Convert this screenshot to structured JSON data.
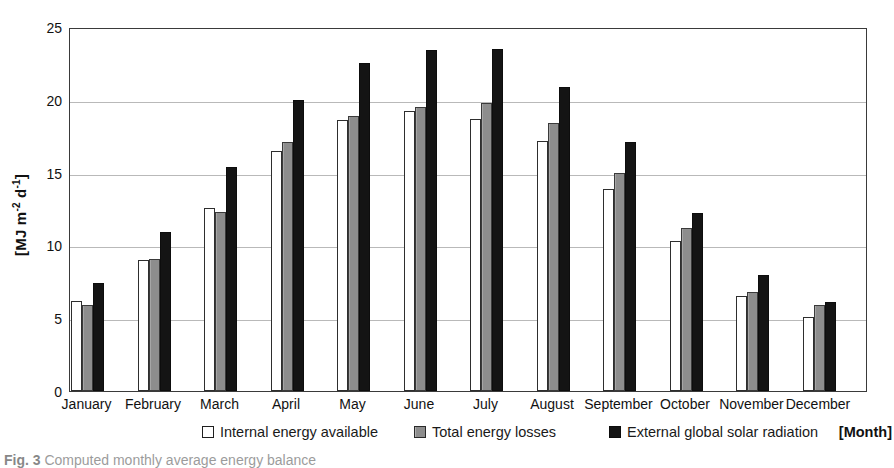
{
  "chart_data": {
    "type": "bar",
    "title": "",
    "xlabel": "[Month]",
    "ylabel": "[MJ m-2 d-1]",
    "ylabel_html": "[MJ m<sup>-2</sup> d<sup>-1</sup>]",
    "ylim": [
      0,
      25
    ],
    "ytick_values": [
      0,
      5,
      10,
      15,
      20,
      25
    ],
    "ytick_labels": [
      "0",
      "5",
      "10",
      "15",
      "20",
      "25"
    ],
    "grid": true,
    "grid_axis": "y",
    "legend_position": "below-axis",
    "categories": [
      "January",
      "February",
      "March",
      "April",
      "May",
      "June",
      "July",
      "August",
      "September",
      "October",
      "November",
      "December"
    ],
    "series": [
      {
        "name": "Internal energy available",
        "key": "internal",
        "color": "#ffffff",
        "edge_color": "#2e2e2e",
        "values": [
          6.2,
          9.0,
          12.6,
          16.5,
          18.6,
          19.2,
          18.7,
          17.2,
          13.9,
          10.3,
          6.5,
          5.1
        ]
      },
      {
        "name": "Total energy losses",
        "key": "losses",
        "color": "#8d8d8d",
        "edge_color": "#3a3a3a",
        "values": [
          5.9,
          9.1,
          12.3,
          17.1,
          18.9,
          19.5,
          19.8,
          18.4,
          15.0,
          11.2,
          6.8,
          5.9
        ]
      },
      {
        "name": "External global solar radiation",
        "key": "solar",
        "color": "#141414",
        "edge_color": "#0d0d0d",
        "values": [
          7.4,
          10.9,
          15.4,
          20.0,
          22.5,
          23.4,
          23.5,
          20.9,
          17.1,
          12.2,
          8.0,
          6.1
        ]
      }
    ]
  },
  "legend": {
    "items": [
      {
        "label": "Internal energy available",
        "swatch": "internal"
      },
      {
        "label": "Total energy losses",
        "swatch": "losses"
      },
      {
        "label": "External global solar radiation",
        "swatch": "solar"
      }
    ]
  },
  "axis": {
    "x_title": "[Month]"
  },
  "caption": {
    "prefix": "Fig. 3",
    "text": "Computed monthly average energy balance"
  }
}
